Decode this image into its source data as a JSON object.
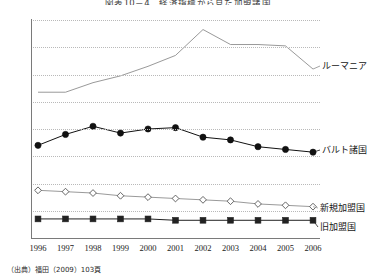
{
  "title": "図表10－4　経済指標から見た加盟諸国",
  "source_note": "（出典）福田（2009）103頁",
  "axis": {
    "y_ticks": [
      "0",
      "20",
      "40",
      "60",
      "80",
      "100",
      "120",
      "140",
      "160"
    ],
    "x_ticks": [
      "1996",
      "1997",
      "1998",
      "1999",
      "2000",
      "2001",
      "2002",
      "2003",
      "2004",
      "2005",
      "2006"
    ]
  },
  "legend": {
    "romania": "ルーマニア",
    "baltic": "バルト諸国",
    "new_members": "新規加盟国",
    "old_members": "旧加盟国"
  },
  "colors": {
    "romania": "#8d8d8d",
    "baltic": "#111111",
    "new_members": "#9a9a9a",
    "old_members": "#222222",
    "grid": "#b9b9b9",
    "axis": "#7a7a7a"
  },
  "chart_data": {
    "type": "line",
    "title": "図表10－4　経済指標から見た加盟諸国",
    "xlabel": "",
    "ylabel": "",
    "x": [
      "1996",
      "1997",
      "1998",
      "1999",
      "2000",
      "2001",
      "2002",
      "2003",
      "2004",
      "2005",
      "2006"
    ],
    "ylim": [
      0,
      160
    ],
    "ytick_step": 20,
    "grid": true,
    "legend_position": "right-inline",
    "series": [
      {
        "name": "ルーマニア",
        "marker": "none",
        "color": "#8d8d8d",
        "values": [
          107,
          107,
          114,
          119,
          126,
          134,
          153,
          142,
          142,
          141,
          124
        ]
      },
      {
        "name": "バルト諸国",
        "marker": "filled-circle",
        "color": "#111111",
        "values": [
          68,
          76,
          82,
          77,
          80,
          81,
          74,
          72,
          67,
          65,
          63
        ]
      },
      {
        "name": "新規加盟国",
        "marker": "open-diamond",
        "color": "#9a9a9a",
        "values": [
          35,
          34,
          33,
          31,
          30,
          29,
          28,
          27,
          25,
          24,
          23
        ]
      },
      {
        "name": "旧加盟国",
        "marker": "filled-square",
        "color": "#222222",
        "values": [
          14,
          14,
          14,
          14,
          14,
          13,
          13,
          13,
          13,
          13,
          13
        ]
      }
    ]
  }
}
